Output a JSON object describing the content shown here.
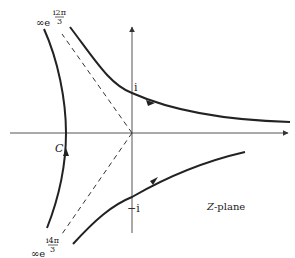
{
  "figure": {
    "plane_label": "Z-plane",
    "plane_label_italic": "Z",
    "plane_label_rest": "-plane",
    "contour_label": "C",
    "upper_imag_label": "i",
    "lower_imag_label": "−i",
    "upper_infinity": {
      "prefix": "∞e",
      "exp_top": "i2π",
      "exp_bottom": "3"
    },
    "lower_infinity": {
      "prefix": "∞e",
      "exp_top": "i4π",
      "exp_bottom": "3"
    }
  },
  "colors": {
    "ink": "#222222",
    "axis": "#555555",
    "background": "#ffffff"
  }
}
